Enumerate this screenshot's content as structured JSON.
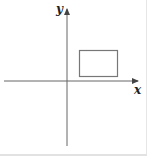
{
  "diagram": {
    "type": "coordinate-plane",
    "axes": {
      "x_label": "x",
      "y_label": "y",
      "color": "#555555"
    },
    "shapes": [
      {
        "type": "rectangle",
        "quadrant": "I",
        "stroke": "#666666",
        "fill": "none"
      }
    ]
  }
}
